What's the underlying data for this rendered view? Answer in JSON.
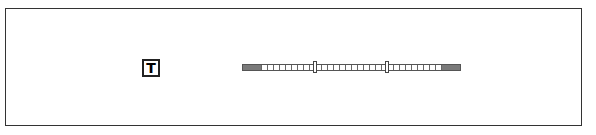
{
  "widget": {
    "tool_icon": {
      "glyph": "T",
      "semantic": "text-tool-icon"
    },
    "range_slider": {
      "handle_low_x": 315,
      "handle_high_x": 387,
      "track_color": "#7a7a7a"
    }
  }
}
